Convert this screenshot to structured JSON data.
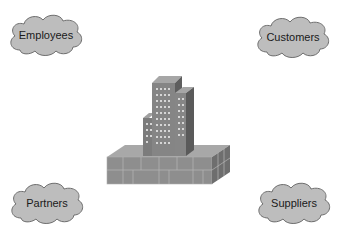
{
  "diagram": {
    "center": {
      "icon": "office-building-icon"
    },
    "clouds": [
      {
        "id": "employees",
        "label": "Employees"
      },
      {
        "id": "customers",
        "label": "Customers"
      },
      {
        "id": "partners",
        "label": "Partners"
      },
      {
        "id": "suppliers",
        "label": "Suppliers"
      }
    ],
    "colors": {
      "cloud_fill": "#bdbdbd",
      "cloud_stroke": "#6e6e6e",
      "building": "#8a8a8a"
    }
  }
}
